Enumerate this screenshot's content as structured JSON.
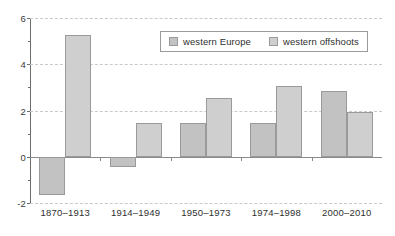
{
  "chart_data": {
    "type": "bar",
    "title": "",
    "subtitle": "",
    "xlabel": "",
    "ylabel": "",
    "categories": [
      "1870–1913",
      "1914–1949",
      "1950–1973",
      "1974–1998",
      "2000–2010"
    ],
    "series": [
      {
        "name": "western Europe",
        "values": [
          -1.67,
          -0.45,
          1.45,
          1.45,
          2.85
        ],
        "color": "#c2c2c2"
      },
      {
        "name": "western offshoots",
        "values": [
          5.25,
          1.45,
          2.55,
          3.05,
          1.95
        ],
        "color": "#cfcfcf"
      }
    ],
    "ylim": [
      -2,
      6
    ],
    "yticks": [
      -2,
      0,
      2,
      4,
      6
    ],
    "ytick_labels": [
      "-2",
      "0",
      "2",
      "4",
      "6"
    ],
    "yminor_ticks": [
      -1,
      1,
      3,
      5
    ],
    "grid": true,
    "grid_axis": "y",
    "grid_style": "dashed",
    "legend_position": "top-center",
    "legend": [
      "western Europe",
      "western offshoots"
    ],
    "background": "#ffffff",
    "axis_color": "#6e6e6e",
    "grid_color": "#c9c9c9"
  }
}
